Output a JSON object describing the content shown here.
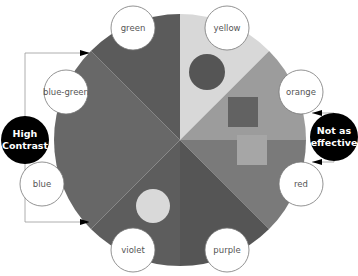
{
  "diagram": {
    "segments": [
      {
        "name": "yellow",
        "label": "yellow",
        "fill": "#d8d8d8"
      },
      {
        "name": "orange",
        "label": "orange",
        "fill": "#9c9c9c"
      },
      {
        "name": "red",
        "label": "red",
        "fill": "#7a7a7a"
      },
      {
        "name": "purple",
        "label": "purple",
        "fill": "#555555"
      },
      {
        "name": "violet",
        "label": "violet",
        "fill": "#5d5d5d"
      },
      {
        "name": "blue",
        "label": "blue",
        "fill": "#676767"
      },
      {
        "name": "blue-green",
        "label": "blue-green",
        "fill": "#686868"
      },
      {
        "name": "green",
        "label": "green",
        "fill": "#5b5b5b"
      }
    ],
    "swatches": [
      {
        "name": "yellow-dark-circle",
        "shape": "circle",
        "fill": "#555555"
      },
      {
        "name": "orange-dark-square",
        "shape": "square",
        "fill": "#626262"
      },
      {
        "name": "red-light-square",
        "shape": "square",
        "fill": "#a6a6a6"
      },
      {
        "name": "violet-light-circle",
        "shape": "circle",
        "fill": "#d9d9d9"
      }
    ],
    "callouts": {
      "left": {
        "line1": "High",
        "line2": "Contrast"
      },
      "right": {
        "line1": "Not as",
        "line2": "effective"
      }
    }
  }
}
